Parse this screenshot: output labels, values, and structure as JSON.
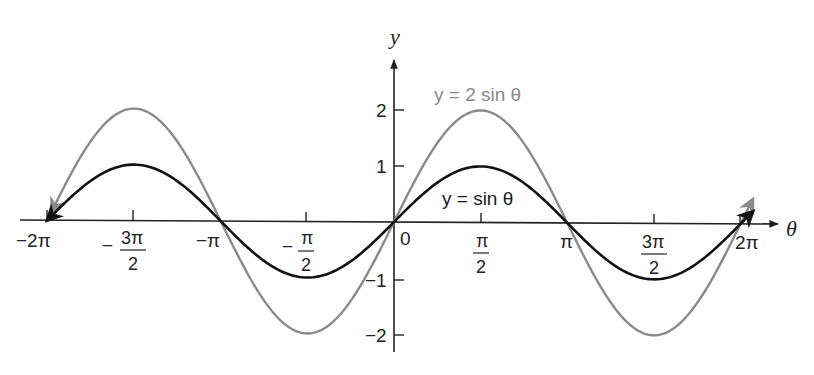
{
  "chart_data": {
    "type": "line",
    "title": "",
    "xlabel": "θ",
    "ylabel": "y",
    "xlim": [
      -6.2832,
      6.2832
    ],
    "ylim": [
      -2,
      2
    ],
    "grid": false,
    "x_ticks": [
      "−2π",
      "−3π/2",
      "−π",
      "−π/2",
      "0",
      "π/2",
      "π",
      "3π/2",
      "2π"
    ],
    "x_tick_values": [
      -6.2832,
      -4.7124,
      -3.1416,
      -1.5708,
      0,
      1.5708,
      3.1416,
      4.7124,
      6.2832
    ],
    "y_ticks": [
      "−2",
      "−1",
      "1",
      "2"
    ],
    "y_tick_values": [
      -2,
      -1,
      1,
      2
    ],
    "series": [
      {
        "name": "y = sin θ",
        "color": "#111111",
        "x": [
          -6.2832,
          -4.7124,
          -3.1416,
          -1.5708,
          0,
          1.5708,
          3.1416,
          4.7124,
          6.2832
        ],
        "values": [
          0,
          1,
          0,
          -1,
          0,
          1,
          0,
          -1,
          0
        ]
      },
      {
        "name": "y = 2 sin θ",
        "color": "#8a8a8a",
        "x": [
          -6.2832,
          -4.7124,
          -3.1416,
          -1.5708,
          0,
          1.5708,
          3.1416,
          4.7124,
          6.2832
        ],
        "values": [
          0,
          2,
          0,
          -2,
          0,
          2,
          0,
          -2,
          0
        ]
      }
    ],
    "annotations": [
      {
        "text": "y = 2 sin θ",
        "near": "peak at π/2 of gray curve"
      },
      {
        "text": "y = sin θ",
        "near": "below peak at π/2 of black curve"
      }
    ],
    "legend_position": "inline labels"
  },
  "labels": {
    "x_axis": "θ",
    "y_axis": "y",
    "origin": "0",
    "neg_2pi": "−2π",
    "neg_3pi2_num": "3π",
    "neg_3pi2_den": "2",
    "neg_pi": "−π",
    "neg_pi2_num": "π",
    "neg_pi2_den": "2",
    "pi2_num": "π",
    "pi2_den": "2",
    "pi": "π",
    "three_pi2_num": "3π",
    "three_pi2_den": "2",
    "two_pi": "2π",
    "minus": "−",
    "y2": "2",
    "y1": "1",
    "yn1": "−1",
    "yn2": "−2",
    "curve_2sin": "y = 2 sin θ",
    "curve_sin": "y = sin θ"
  }
}
